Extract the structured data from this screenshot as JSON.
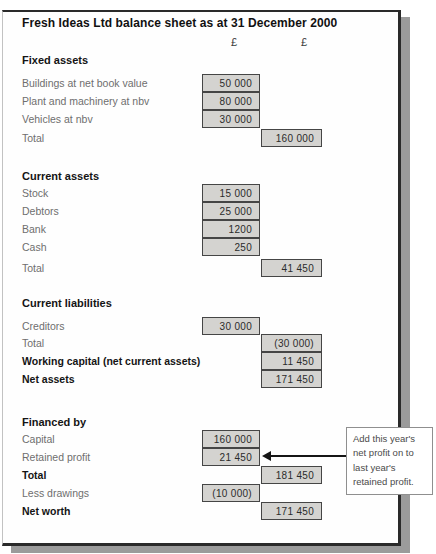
{
  "title": "Fresh Ideas Ltd balance sheet as at 31 December 2000",
  "column_headers": [
    "£",
    "£"
  ],
  "sections": [
    {
      "heading": "Fixed assets",
      "rows": [
        {
          "label": "Buildings at net book value",
          "value": "50 000"
        },
        {
          "label": "Plant and machinery at nbv",
          "value": "80 000"
        },
        {
          "label": "Vehicles at nbv",
          "value": "30 000"
        },
        {
          "label": "Total",
          "value": "160 000"
        }
      ]
    },
    {
      "heading": "Current assets",
      "rows": [
        {
          "label": "Stock",
          "value": "15 000"
        },
        {
          "label": "Debtors",
          "value": "25 000"
        },
        {
          "label": "Bank",
          "value": "1200"
        },
        {
          "label": "Cash",
          "value": "250"
        },
        {
          "label": "Total",
          "value": "41 450"
        }
      ]
    },
    {
      "heading": "Current liabilities",
      "rows": [
        {
          "label": "Creditors",
          "value": "30 000"
        },
        {
          "label": "Total",
          "value": "(30 000)"
        },
        {
          "label": "Working capital (net current assets)",
          "value": "11 450"
        },
        {
          "label": "Net assets",
          "value": "171 450"
        }
      ]
    },
    {
      "heading": "Financed by",
      "rows": [
        {
          "label": "Capital",
          "value": "160 000"
        },
        {
          "label": "Retained profit",
          "value": "21 450"
        },
        {
          "label": "Total",
          "value": "181 450"
        },
        {
          "label": "Less drawings",
          "value": "(10 000)"
        },
        {
          "label": "Net worth",
          "value": "171 450"
        }
      ]
    }
  ],
  "callout": {
    "text": "Add this year's net profit on to last year's retained profit."
  },
  "colors": {
    "box_fill": "#d4d3d0",
    "box_border": "#454545",
    "page_shadow": "#9b9b9b",
    "arrow": "#151515"
  }
}
